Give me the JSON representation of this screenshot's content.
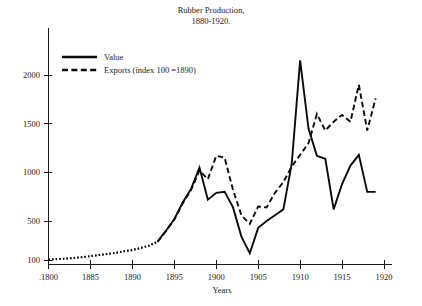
{
  "chart_data": {
    "type": "line",
    "title": "Rubber Production,",
    "subtitle": "1880-1920.",
    "xlabel": "Years",
    "ylabel": "",
    "xlim": [
      1880,
      1920
    ],
    "ylim": [
      100,
      2150
    ],
    "grid": false,
    "legend_position": "top-left",
    "xticks": [
      1880,
      1885,
      1890,
      1895,
      1900,
      1905,
      1910,
      1915,
      1920
    ],
    "xtick_labels": [
      ".1800",
      "1885",
      "1890",
      "1895",
      "1900",
      "1905",
      "1910",
      "1915",
      "1920"
    ],
    "yticks": [
      100,
      500,
      1000,
      1500,
      2000
    ],
    "ytick_labels": [
      "100",
      "500",
      "1000",
      "1500",
      "2000"
    ],
    "series": [
      {
        "name": "Value",
        "style": "solid",
        "x": [
          1880,
          1881,
          1882,
          1883,
          1884,
          1885,
          1886,
          1887,
          1888,
          1889,
          1890,
          1891,
          1892,
          1893,
          1894,
          1895,
          1896,
          1897,
          1898,
          1899,
          1900,
          1901,
          1902,
          1903,
          1904,
          1905,
          1906,
          1907,
          1908,
          1909,
          1910,
          1911,
          1912,
          1913,
          1914,
          1915,
          1916,
          1917,
          1918,
          1919
        ],
        "values": [
          105,
          110,
          115,
          122,
          130,
          140,
          152,
          163,
          175,
          190,
          205,
          225,
          250,
          290,
          400,
          520,
          690,
          830,
          1050,
          720,
          790,
          800,
          640,
          340,
          170,
          430,
          500,
          560,
          620,
          1090,
          2150,
          1450,
          1170,
          1140,
          620,
          880,
          1070,
          1180,
          800,
          800
        ],
        "dotted_lead_until": 1893
      },
      {
        "name": "Exports (index 100 =1890)",
        "style": "dashed",
        "x": [
          1880,
          1881,
          1882,
          1883,
          1884,
          1885,
          1886,
          1887,
          1888,
          1889,
          1890,
          1891,
          1892,
          1893,
          1894,
          1895,
          1896,
          1897,
          1898,
          1899,
          1900,
          1901,
          1902,
          1903,
          1904,
          1905,
          1906,
          1907,
          1908,
          1909,
          1910,
          1911,
          1912,
          1913,
          1914,
          1915,
          1916,
          1917,
          1918,
          1919
        ],
        "values": [
          103,
          108,
          113,
          120,
          128,
          138,
          150,
          160,
          172,
          188,
          200,
          222,
          248,
          285,
          395,
          515,
          680,
          820,
          1020,
          930,
          1170,
          1150,
          820,
          560,
          470,
          650,
          640,
          790,
          900,
          1060,
          1180,
          1300,
          1600,
          1430,
          1520,
          1590,
          1520,
          1900,
          1430,
          1760
        ],
        "dotted_lead_until": 1893
      }
    ],
    "annotations": []
  },
  "legend": {
    "items": [
      {
        "label": "Value",
        "style": "solid"
      },
      {
        "label": "Exports (index 100 =1890)",
        "style": "dashed"
      }
    ]
  }
}
